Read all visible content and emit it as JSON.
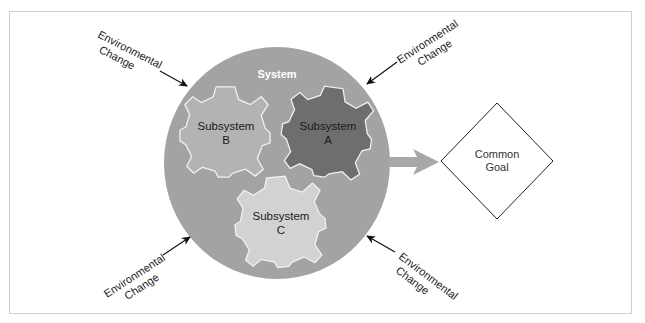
{
  "diagram": {
    "system": {
      "label": "System",
      "color": "#a3a3a3"
    },
    "subsystems": [
      {
        "id": "A",
        "line1": "Subsystem",
        "line2": "A",
        "color": "#6e6e6e"
      },
      {
        "id": "B",
        "line1": "Subsystem",
        "line2": "B",
        "color": "#b3b3b3"
      },
      {
        "id": "C",
        "line1": "Subsystem",
        "line2": "C",
        "color": "#d2d2d2"
      }
    ],
    "goal": {
      "line1": "Common",
      "line2": "Goal"
    },
    "environmental_changes": [
      {
        "position": "top-left",
        "line1": "Environmental",
        "line2": "Change"
      },
      {
        "position": "top-right",
        "line1": "Environmental",
        "line2": "Change"
      },
      {
        "position": "bottom-left",
        "line1": "Environmental",
        "line2": "Change"
      },
      {
        "position": "bottom-right",
        "line1": "Environmental",
        "line2": "Change"
      }
    ],
    "colors": {
      "output_arrow": "#a8a8a8",
      "gear_outline": "#f2f2f2",
      "frame_border": "#cfcfcf"
    }
  }
}
